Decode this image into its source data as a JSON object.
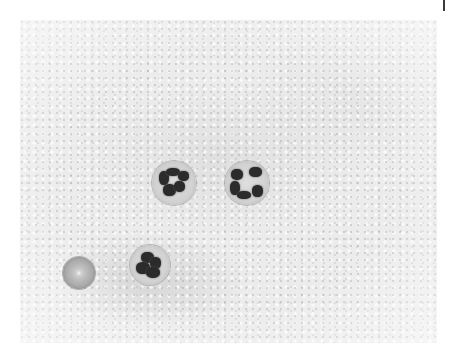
{
  "image": {
    "subject": "blood smear micrograph",
    "description": "Grayscale microscope view with three neutrophils (segmented nuclei) and one red blood cell on a grainy background",
    "cells": [
      {
        "type": "neutrophil",
        "x": 174,
        "y": 183,
        "d": 44
      },
      {
        "type": "neutrophil",
        "x": 247,
        "y": 183,
        "d": 44
      },
      {
        "type": "neutrophil",
        "x": 150,
        "y": 265,
        "d": 40
      },
      {
        "type": "red-blood-cell",
        "x": 79,
        "y": 273,
        "d": 32
      }
    ],
    "colors": {
      "background": "#ececec",
      "nucleus": "#2b2b2b",
      "page": "#ffffff"
    }
  }
}
